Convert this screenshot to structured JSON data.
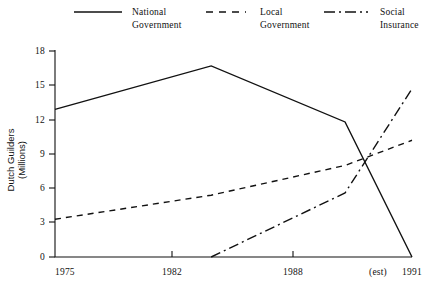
{
  "chart_data": {
    "type": "line",
    "title": "",
    "xlabel": "",
    "ylabel": "Dutch Guilders\n(Millions)",
    "ylabel_line1": "Dutch Guilders",
    "ylabel_line2": "(Millions)",
    "x": [
      1975,
      1982,
      1988,
      1991
    ],
    "xtick_labels": [
      "1975",
      "1982",
      "1988",
      "1991"
    ],
    "xtick_extra": "(est)",
    "ytick_labels": [
      "0",
      "3",
      "6",
      "9",
      "12",
      "15",
      "18"
    ],
    "ytick_values": [
      0,
      3,
      6,
      9,
      12,
      15,
      18
    ],
    "ylim": [
      0,
      18
    ],
    "xlim": [
      1975,
      1991
    ],
    "grid": false,
    "legend_position": "top",
    "series": [
      {
        "name": "National\nGovernment",
        "name_line1": "National",
        "name_line2": "Government",
        "style": "solid",
        "color": "#111111",
        "x": [
          1975,
          1982,
          1988,
          1991
        ],
        "values": [
          12.9,
          16.7,
          11.8,
          0
        ]
      },
      {
        "name": "Local\nGovernment",
        "name_line1": "Local",
        "name_line2": "Government",
        "style": "dashed",
        "color": "#111111",
        "x": [
          1975,
          1982,
          1988,
          1991
        ],
        "values": [
          3.3,
          5.4,
          8.0,
          10.2
        ]
      },
      {
        "name": "Social\nInsurance",
        "name_line1": "Social",
        "name_line2": "Insurance",
        "style": "dashdot",
        "color": "#111111",
        "x": [
          1982,
          1988,
          1991
        ],
        "values": [
          0,
          5.6,
          14.7
        ]
      }
    ]
  },
  "legend": {
    "entries": [
      {
        "label": "National\nGovernment",
        "style": "solid"
      },
      {
        "label": "Local\nGovernment",
        "style": "dashed"
      },
      {
        "label": "Social\nInsurance",
        "style": "dashdot"
      }
    ]
  },
  "axes": {
    "y_title": "Dutch Guilders\n(Millions)",
    "y_ticks": [
      "18",
      "15",
      "12",
      "9",
      "6",
      "3",
      "0"
    ],
    "x_ticks": [
      "1975",
      "1982",
      "1988",
      "1991"
    ],
    "x_est_note": "(est)"
  }
}
